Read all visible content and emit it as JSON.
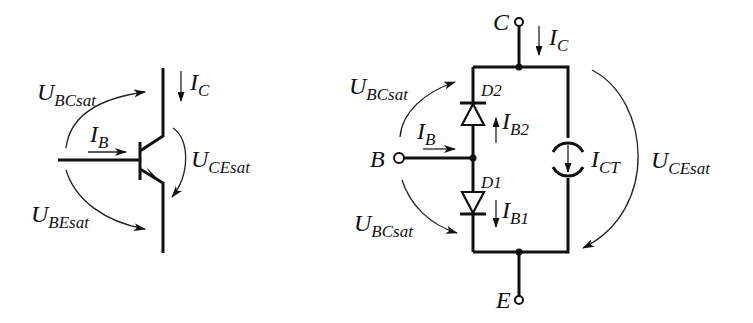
{
  "left_symbol": {
    "title": "NPN transistor in saturation",
    "labels": {
      "ic": {
        "main": "I",
        "sub": "C"
      },
      "ib": {
        "main": "I",
        "sub": "B"
      },
      "ubc": {
        "main": "U",
        "sub": "BCsat"
      },
      "ube": {
        "main": "U",
        "sub": "BEsat"
      },
      "uce": {
        "main": "U",
        "sub": "CEsat"
      }
    }
  },
  "right_model": {
    "title": "Saturation equivalent circuit",
    "terminals": {
      "collector": "C",
      "base": "B",
      "emitter": "E"
    },
    "diodes": {
      "d2": "D2",
      "d1": "D1"
    },
    "labels": {
      "ic": {
        "main": "I",
        "sub": "C"
      },
      "ib": {
        "main": "I",
        "sub": "B"
      },
      "ib2": {
        "main": "I",
        "sub": "B2"
      },
      "ib1": {
        "main": "I",
        "sub": "B1"
      },
      "ict": {
        "main": "I",
        "sub": "CT"
      },
      "ubc_top": {
        "main": "U",
        "sub": "BCsat"
      },
      "ubc_bottom": {
        "main": "U",
        "sub": "BCsat"
      },
      "uce": {
        "main": "U",
        "sub": "CEsat"
      }
    }
  },
  "colors": {
    "ink": "#111111",
    "background": "#ffffff"
  }
}
